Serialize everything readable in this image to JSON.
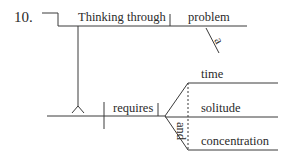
{
  "diagram": {
    "type": "sentence-diagram",
    "item_number": "10.",
    "subject_phrase": {
      "gerund_verb": "Thinking through",
      "object": "problem",
      "modifier": "a"
    },
    "predicate": {
      "verb": "requires",
      "compound_objects": [
        "time",
        "solitude",
        "concentration"
      ],
      "conjunction": "and"
    },
    "colors": {
      "line": "#3a3a3a",
      "text": "#2a2a2a",
      "background": "#ffffff"
    }
  }
}
